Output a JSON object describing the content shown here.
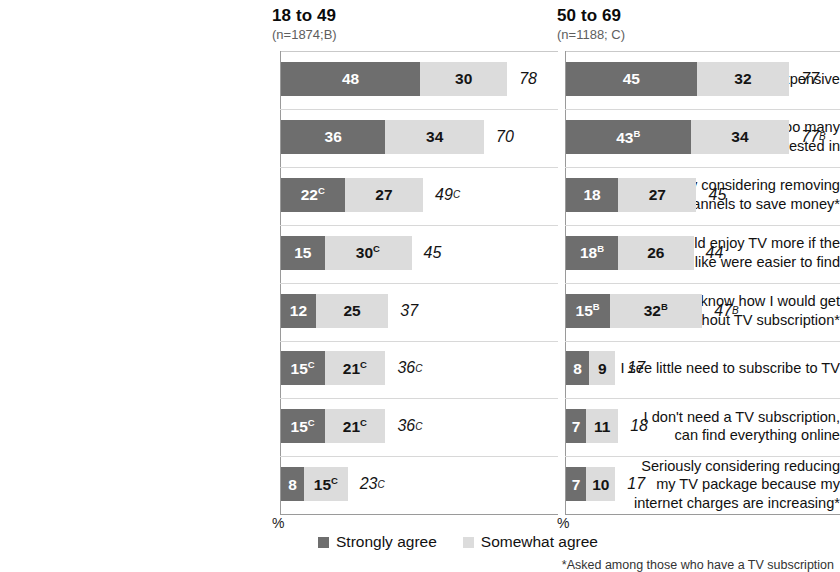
{
  "chart_data": {
    "type": "bar",
    "title": "",
    "subtitle": "",
    "orientation": "horizontal",
    "stacked": true,
    "xlabel": "%",
    "ylabel": "",
    "xlim": [
      0,
      100
    ],
    "grid": true,
    "legend_position": "bottom",
    "legend": [
      "Strongly agree",
      "Somewhat agree"
    ],
    "series": [
      {
        "name": "Strongly agree",
        "color": "#6e6e6e"
      },
      {
        "name": "Somewhat agree",
        "color": "#dcdcdc"
      }
    ],
    "panels": [
      {
        "id": "B",
        "title": "18 to 49",
        "subtitle": "(n=1874;B)",
        "n": 1874
      },
      {
        "id": "C",
        "title": "50 to 69",
        "subtitle": "(n=1188; C)",
        "n": 1188
      }
    ],
    "categories": [
      "TV subscriptions are too expensive",
      "TV packages include too many channels I'm not interested in",
      "Seriously considering removing some channels to save money*",
      "Would enjoy TV more if the programs I like were easier to find",
      "Don't know how I would get by without TV subscription*",
      "I see little need to subscribe to TV",
      "I don't need a TV subscription, can find everything online",
      "Seriously considering reducing my TV package because my internet charges are increasing*"
    ],
    "rows": [
      {
        "label_lines": [
          "TV subscriptions are too expensive"
        ],
        "panel_b": {
          "strongly": 48,
          "strongly_sig": "",
          "somewhat": 30,
          "somewhat_sig": "",
          "net": 78,
          "net_sig": ""
        },
        "panel_c": {
          "strongly": 45,
          "strongly_sig": "",
          "somewhat": 32,
          "somewhat_sig": "",
          "net": 77,
          "net_sig": ""
        }
      },
      {
        "label_lines": [
          "TV packages include too many",
          "channels I'm not interested in"
        ],
        "panel_b": {
          "strongly": 36,
          "strongly_sig": "",
          "somewhat": 34,
          "somewhat_sig": "",
          "net": 70,
          "net_sig": ""
        },
        "panel_c": {
          "strongly": 43,
          "strongly_sig": "B",
          "somewhat": 34,
          "somewhat_sig": "",
          "net": 77,
          "net_sig": "B"
        }
      },
      {
        "label_lines": [
          "Seriously considering removing",
          "some channels to save money*"
        ],
        "panel_b": {
          "strongly": 22,
          "strongly_sig": "C",
          "somewhat": 27,
          "somewhat_sig": "",
          "net": 49,
          "net_sig": "C"
        },
        "panel_c": {
          "strongly": 18,
          "strongly_sig": "",
          "somewhat": 27,
          "somewhat_sig": "",
          "net": 45,
          "net_sig": ""
        }
      },
      {
        "label_lines": [
          "Would enjoy TV more if the",
          "programs I like were easier to find"
        ],
        "panel_b": {
          "strongly": 15,
          "strongly_sig": "",
          "somewhat": 30,
          "somewhat_sig": "C",
          "net": 45,
          "net_sig": ""
        },
        "panel_c": {
          "strongly": 18,
          "strongly_sig": "B",
          "somewhat": 26,
          "somewhat_sig": "",
          "net": 44,
          "net_sig": ""
        }
      },
      {
        "label_lines": [
          "Don't know how I would get",
          "by without TV subscription*"
        ],
        "panel_b": {
          "strongly": 12,
          "strongly_sig": "",
          "somewhat": 25,
          "somewhat_sig": "",
          "net": 37,
          "net_sig": ""
        },
        "panel_c": {
          "strongly": 15,
          "strongly_sig": "B",
          "somewhat": 32,
          "somewhat_sig": "B",
          "net": 47,
          "net_sig": "B"
        }
      },
      {
        "label_lines": [
          "I see little need to subscribe to TV"
        ],
        "panel_b": {
          "strongly": 15,
          "strongly_sig": "C",
          "somewhat": 21,
          "somewhat_sig": "C",
          "net": 36,
          "net_sig": "C"
        },
        "panel_c": {
          "strongly": 8,
          "strongly_sig": "",
          "somewhat": 9,
          "somewhat_sig": "",
          "net": 17,
          "net_sig": ""
        }
      },
      {
        "label_lines": [
          "I don't need a TV subscription,",
          "can find everything online"
        ],
        "panel_b": {
          "strongly": 15,
          "strongly_sig": "C",
          "somewhat": 21,
          "somewhat_sig": "C",
          "net": 36,
          "net_sig": "C"
        },
        "panel_c": {
          "strongly": 7,
          "strongly_sig": "",
          "somewhat": 11,
          "somewhat_sig": "",
          "net": 18,
          "net_sig": ""
        }
      },
      {
        "label_lines": [
          "Seriously considering reducing",
          "my TV package because my",
          "internet charges are increasing*"
        ],
        "panel_b": {
          "strongly": 8,
          "strongly_sig": "",
          "somewhat": 15,
          "somewhat_sig": "C",
          "net": 23,
          "net_sig": "C"
        },
        "panel_c": {
          "strongly": 7,
          "strongly_sig": "",
          "somewhat": 10,
          "somewhat_sig": "",
          "net": 17,
          "net_sig": ""
        }
      }
    ]
  },
  "axis": {
    "pct_left": "%",
    "pct_right": "%"
  },
  "footnote": "*Asked among those who have a TV subscription"
}
